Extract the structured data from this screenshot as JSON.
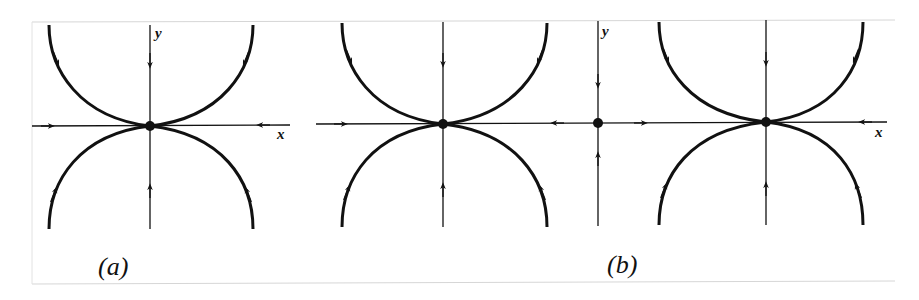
{
  "figure": {
    "panels": [
      {
        "id": "a",
        "caption": "(a)",
        "x_label": "x",
        "y_label": "y",
        "fixed_points": [
          "saddle-node at origin"
        ]
      },
      {
        "id": "b",
        "caption": "(b)",
        "x_label": "x",
        "y_label": "y",
        "fixed_points": [
          "saddle-node (left)",
          "origin",
          "saddle-node (right)"
        ]
      }
    ],
    "colors": {
      "ink": "#111111",
      "frame": "#d0d0d0",
      "background": "#ffffff"
    }
  }
}
